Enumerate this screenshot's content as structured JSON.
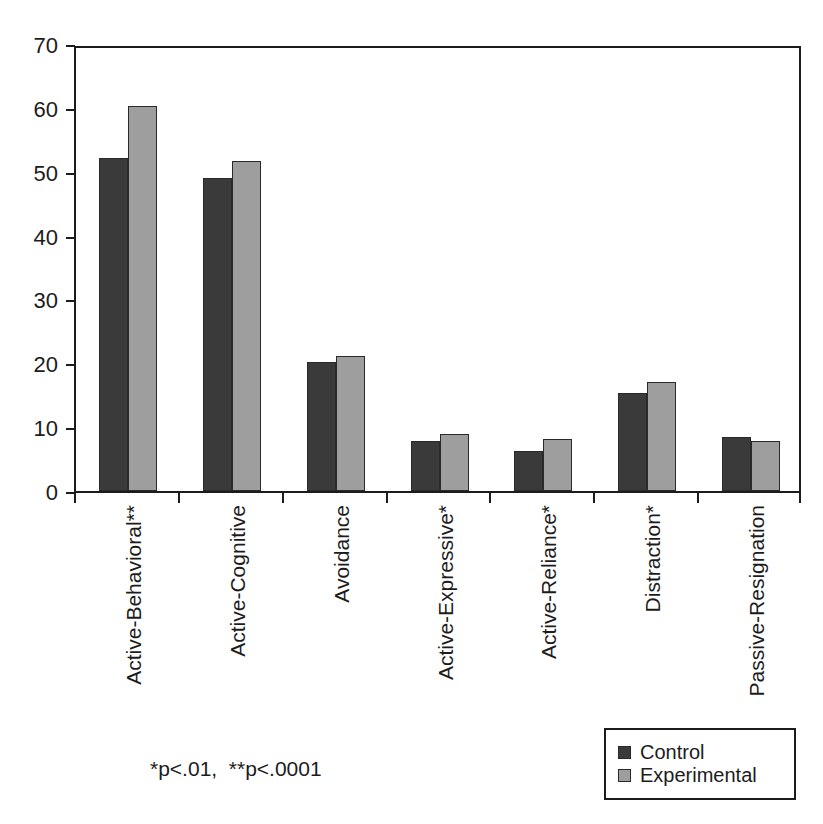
{
  "chart_data": {
    "type": "bar",
    "title": "",
    "xlabel": "",
    "ylabel": "",
    "ylim": [
      0,
      70
    ],
    "yticks": [
      0,
      10,
      20,
      30,
      40,
      50,
      60,
      70
    ],
    "ytick_labels": [
      "0",
      "10",
      "20",
      "30",
      "40",
      "50",
      "60",
      "70"
    ],
    "grid": false,
    "legend_position": "bottom-right",
    "categories": [
      "Active-Behavioral**",
      "Active-Cognitive",
      "Avoidance",
      "Active-Expressive*",
      "Active-Reliance*",
      "Distraction*",
      "Passive-Resignation"
    ],
    "series": [
      {
        "name": "Control",
        "color": "#3a3a3a",
        "values": [
          52.2,
          49.0,
          20.2,
          7.8,
          6.3,
          15.3,
          8.4
        ]
      },
      {
        "name": "Experimental",
        "color": "#9e9e9e",
        "values": [
          60.3,
          51.7,
          21.1,
          9.0,
          8.2,
          17.1,
          7.8
        ]
      }
    ],
    "annotations": [
      "*p<.01,  **p<.0001"
    ]
  },
  "footnote": "*p<.01,  **p<.0001",
  "legend": {
    "items": [
      {
        "label": "Control",
        "color": "#3a3a3a"
      },
      {
        "label": "Experimental",
        "color": "#9e9e9e"
      }
    ]
  },
  "colors": {
    "control": "#3a3a3a",
    "experimental": "#9e9e9e",
    "axis": "#1c1c1c",
    "background": "#ffffff"
  }
}
